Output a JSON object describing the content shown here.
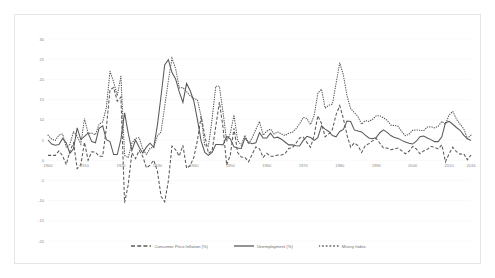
{
  "chart_data": {
    "type": "line",
    "title": "",
    "subtitle": "",
    "xlabel": "",
    "ylabel": "",
    "xlim": [
      1900,
      2016
    ],
    "ylim": [
      -20,
      30
    ],
    "grid": true,
    "legend_position": "bottom-center",
    "x_ticks": [
      "1900",
      "1910",
      "1920",
      "1930",
      "1940",
      "1950",
      "1960",
      "1970",
      "1980",
      "1990",
      "2000",
      "2010",
      "2016"
    ],
    "y_ticks": [
      "30",
      "25",
      "20",
      "15",
      "10",
      "5",
      "0",
      "-5",
      "-10",
      "-15",
      "-20"
    ],
    "colors": {
      "line": "#595959",
      "grid": "#f2f2f2",
      "tick_text": "#8a8a8a",
      "border": "#e6e6e6"
    },
    "x": [
      1900,
      1901,
      1902,
      1903,
      1904,
      1905,
      1906,
      1907,
      1908,
      1909,
      1910,
      1911,
      1912,
      1913,
      1914,
      1915,
      1916,
      1917,
      1918,
      1919,
      1920,
      1921,
      1922,
      1923,
      1924,
      1925,
      1926,
      1927,
      1928,
      1929,
      1930,
      1931,
      1932,
      1933,
      1934,
      1935,
      1936,
      1937,
      1938,
      1939,
      1940,
      1941,
      1942,
      1943,
      1944,
      1945,
      1946,
      1947,
      1948,
      1949,
      1950,
      1951,
      1952,
      1953,
      1954,
      1955,
      1956,
      1957,
      1958,
      1959,
      1960,
      1961,
      1962,
      1963,
      1964,
      1965,
      1966,
      1967,
      1968,
      1969,
      1970,
      1971,
      1972,
      1973,
      1974,
      1975,
      1976,
      1977,
      1978,
      1979,
      1980,
      1981,
      1982,
      1983,
      1984,
      1985,
      1986,
      1987,
      1988,
      1989,
      1990,
      1991,
      1992,
      1993,
      1994,
      1995,
      1996,
      1997,
      1998,
      1999,
      2000,
      2001,
      2002,
      2003,
      2004,
      2005,
      2006,
      2007,
      2008,
      2009,
      2010,
      2011,
      2012,
      2013,
      2014,
      2015,
      2016
    ],
    "series": [
      {
        "name": "Consumer Price Inflation (%)",
        "style": "dashed",
        "values": [
          1.2,
          1.2,
          1.2,
          2.3,
          1.1,
          -1.1,
          2.2,
          4.3,
          -2.1,
          -1.1,
          4.4,
          0.0,
          2.1,
          2.0,
          1.0,
          1.0,
          7.9,
          17.4,
          18.0,
          14.6,
          15.6,
          -10.5,
          -6.1,
          1.8,
          0.4,
          2.4,
          0.9,
          -1.9,
          -1.2,
          0.0,
          -2.7,
          -8.9,
          -10.3,
          -5.2,
          3.5,
          2.6,
          1.0,
          3.7,
          -2.0,
          -1.3,
          0.7,
          5.0,
          10.9,
          6.1,
          1.7,
          2.3,
          8.3,
          14.4,
          8.1,
          -1.2,
          1.3,
          7.9,
          1.9,
          0.8,
          0.7,
          -0.4,
          1.5,
          3.3,
          2.8,
          0.7,
          1.7,
          1.0,
          1.0,
          1.3,
          1.3,
          1.6,
          2.9,
          3.1,
          4.2,
          5.5,
          5.7,
          4.4,
          3.2,
          6.2,
          11.0,
          9.1,
          5.8,
          6.5,
          7.6,
          11.3,
          13.5,
          10.3,
          6.2,
          3.2,
          4.3,
          3.6,
          1.9,
          3.6,
          4.1,
          4.8,
          5.4,
          4.2,
          3.0,
          3.0,
          2.6,
          2.8,
          3.0,
          2.3,
          1.6,
          2.2,
          3.4,
          2.8,
          1.6,
          2.3,
          2.7,
          3.4,
          3.2,
          2.8,
          3.8,
          -0.4,
          1.6,
          3.2,
          2.1,
          1.5,
          1.6,
          0.1,
          1.3
        ]
      },
      {
        "name": "Unemployment (%)",
        "style": "solid",
        "values": [
          5.0,
          4.0,
          3.7,
          3.9,
          5.4,
          4.3,
          1.7,
          2.8,
          8.0,
          5.1,
          5.9,
          6.7,
          4.6,
          4.3,
          7.9,
          8.5,
          5.1,
          4.6,
          1.4,
          1.4,
          5.2,
          11.7,
          6.7,
          2.4,
          5.0,
          3.2,
          1.8,
          3.3,
          4.2,
          3.2,
          8.7,
          15.9,
          23.6,
          24.9,
          21.7,
          20.1,
          16.9,
          14.3,
          19.0,
          17.2,
          14.6,
          9.9,
          4.7,
          1.9,
          1.2,
          1.9,
          3.9,
          3.9,
          3.8,
          5.9,
          5.3,
          3.3,
          3.0,
          2.9,
          5.5,
          4.4,
          4.1,
          4.3,
          6.8,
          5.5,
          5.5,
          6.7,
          5.5,
          5.7,
          5.2,
          4.5,
          3.8,
          3.8,
          3.6,
          3.5,
          4.9,
          5.9,
          5.6,
          4.9,
          5.6,
          8.5,
          7.7,
          7.1,
          6.1,
          5.8,
          7.1,
          7.6,
          9.7,
          9.6,
          7.5,
          7.2,
          7.0,
          6.2,
          5.5,
          5.3,
          5.6,
          6.8,
          7.5,
          6.9,
          6.1,
          5.6,
          5.4,
          4.9,
          4.5,
          4.2,
          4.0,
          4.7,
          5.8,
          6.0,
          5.5,
          5.1,
          4.6,
          4.6,
          5.8,
          9.3,
          9.6,
          8.9,
          8.1,
          7.4,
          6.2,
          5.3,
          4.9
        ]
      },
      {
        "name": "Misery Index",
        "style": "dotted",
        "values": [
          6.2,
          5.2,
          4.9,
          6.2,
          6.5,
          3.2,
          3.9,
          7.1,
          5.9,
          4.0,
          10.3,
          6.7,
          6.7,
          6.3,
          8.9,
          9.5,
          13.0,
          22.0,
          19.4,
          16.0,
          20.8,
          1.2,
          0.6,
          4.2,
          5.4,
          5.6,
          2.7,
          1.4,
          3.0,
          3.2,
          6.0,
          7.0,
          13.3,
          19.7,
          25.2,
          22.7,
          17.9,
          18.0,
          17.0,
          15.9,
          15.3,
          14.9,
          10.8,
          3.6,
          3.5,
          10.2,
          18.3,
          18.3,
          11.9,
          4.7,
          6.6,
          11.2,
          4.9,
          3.7,
          6.2,
          4.0,
          5.6,
          7.6,
          9.6,
          6.2,
          7.2,
          7.7,
          6.5,
          7.0,
          6.5,
          6.1,
          6.7,
          6.9,
          7.8,
          9.0,
          10.6,
          10.3,
          8.8,
          11.1,
          16.6,
          17.6,
          12.9,
          13.6,
          13.9,
          19.0,
          24.1,
          21.1,
          15.9,
          12.8,
          11.8,
          10.8,
          8.9,
          9.8,
          9.6,
          10.1,
          11.0,
          11.0,
          10.5,
          9.9,
          8.7,
          8.6,
          8.4,
          7.1,
          6.1,
          6.4,
          7.4,
          7.5,
          7.4,
          7.3,
          8.2,
          8.3,
          8.0,
          8.4,
          9.6,
          8.9,
          11.2,
          12.1,
          10.2,
          8.9,
          7.8,
          5.4,
          6.2
        ]
      }
    ]
  },
  "legend": {
    "items": [
      {
        "label": "Consumer Price Inflation (%)",
        "marker": "dashed-line-marker"
      },
      {
        "label": "Unemployment (%)",
        "marker": "solid-line-marker"
      },
      {
        "label": "Misery Index",
        "marker": "dotted-line-marker"
      }
    ]
  }
}
